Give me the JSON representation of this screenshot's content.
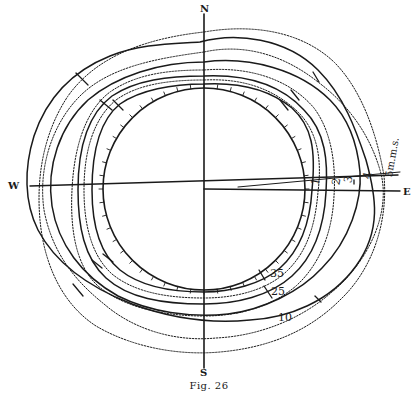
{
  "figure": {
    "caption": "Fig. 26",
    "compass": {
      "north": "N",
      "south": "S",
      "west": "W",
      "east": "E"
    },
    "contour_labels": {
      "c1": "1",
      "c2": "2",
      "c3": "3",
      "c4": "4",
      "c5": "5m.m.s.",
      "c35": "35",
      "c25": "25",
      "c10": "10"
    },
    "style": {
      "ink_color": "#1a1a1a",
      "background": "#ffffff"
    }
  }
}
